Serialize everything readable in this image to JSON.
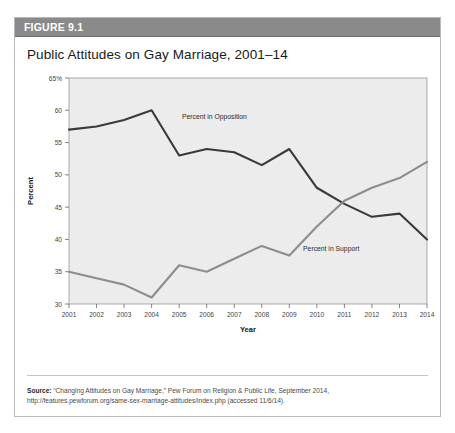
{
  "figure": {
    "header_label": "FIGURE 9.1",
    "title": "Public Attitudes on Gay Marriage, 2001–14",
    "header_bg": "#8a8a8a",
    "card_border": "#b9b9b9"
  },
  "source": {
    "prefix": "Source:",
    "line1": " “Changing Attitudes on Gay Marriage,” Pew Forum on Religion & Public Life, September 2014,",
    "line2": "http://features.pewforum.org/same-sex-marriage-attitudes/index.php (accessed 11/6/14)."
  },
  "chart_data": {
    "type": "line",
    "title": "Public Attitudes on Gay Marriage, 2001–14",
    "xlabel": "Year",
    "ylabel": "Percent",
    "x": [
      2001,
      2002,
      2003,
      2004,
      2005,
      2006,
      2007,
      2008,
      2009,
      2010,
      2011,
      2012,
      2013,
      2014
    ],
    "xtick_labels": [
      "2001",
      "2002",
      "2003",
      "2004",
      "2005",
      "2006",
      "2007",
      "2008",
      "2009",
      "2010",
      "2011",
      "2012",
      "2013",
      "2014"
    ],
    "ylim": [
      30,
      65
    ],
    "ytick_labels": [
      "30",
      "35",
      "40",
      "45",
      "50",
      "55",
      "60",
      "65%"
    ],
    "yticks": [
      30,
      35,
      40,
      45,
      50,
      55,
      60,
      65
    ],
    "grid": false,
    "plot_bg": "#ececec",
    "legend": "inline-annotations",
    "series": [
      {
        "name": "Percent in Opposition",
        "color": "#3a3a3a",
        "label_x": 2005.1,
        "label_y": 58.6,
        "values": [
          57,
          57.5,
          58.5,
          60,
          53,
          54,
          53.5,
          51.5,
          54,
          48,
          45.5,
          43.5,
          44,
          40
        ]
      },
      {
        "name": "Percent in Support",
        "color": "#8d8d8d",
        "label_x": 2009.5,
        "label_y": 38.2,
        "values": [
          35,
          34,
          33,
          31,
          36,
          35,
          37,
          39,
          37.5,
          42,
          46,
          48,
          49.5,
          52
        ]
      }
    ]
  }
}
